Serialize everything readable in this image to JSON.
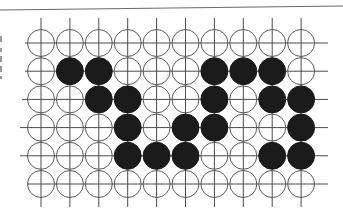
{
  "diagram": {
    "type": "go-board-fragment",
    "columns": 10,
    "rows": 6,
    "origin": {
      "x": 41,
      "y": 43
    },
    "spacing": {
      "x": 28.9,
      "y": 28.2
    },
    "stone_radius": 13.5,
    "colors": {
      "black_stone": "#1b1b1b",
      "white_stone_fill": "#ffffff",
      "white_stone_outline": "#5a5a5a",
      "grid_line": "#4a4a4a",
      "background": "#ffffff"
    },
    "legend": {
      "B": "black stone",
      "W": "white (empty) stone"
    },
    "board": [
      [
        "W",
        "W",
        "W",
        "W",
        "W",
        "W",
        "W",
        "W",
        "W",
        "W"
      ],
      [
        "W",
        "B",
        "B",
        "W",
        "W",
        "W",
        "B",
        "B",
        "B",
        "W"
      ],
      [
        "W",
        "W",
        "B",
        "B",
        "W",
        "W",
        "B",
        "W",
        "B",
        "B"
      ],
      [
        "W",
        "W",
        "W",
        "B",
        "W",
        "B",
        "B",
        "W",
        "W",
        "B"
      ],
      [
        "W",
        "W",
        "W",
        "B",
        "B",
        "B",
        "W",
        "W",
        "B",
        "B"
      ],
      [
        "W",
        "W",
        "W",
        "W",
        "W",
        "W",
        "W",
        "W",
        "W",
        "W"
      ]
    ]
  }
}
